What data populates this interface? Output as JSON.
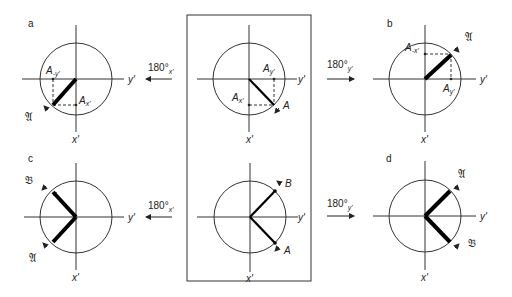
{
  "panels": {
    "a": {
      "letter": "a",
      "axis_y": "y'",
      "axis_x": "x'",
      "proj_neg_y": "A",
      "proj_neg_y_sub": "-y'",
      "proj_x": "A",
      "proj_x_sub": "x'",
      "vector": "𝔄"
    },
    "center_top": {
      "axis_y": "y'",
      "axis_x": "x'",
      "proj_y": "A",
      "proj_y_sub": "y'",
      "proj_x": "A",
      "proj_x_sub": "x'",
      "vector": "A"
    },
    "b": {
      "letter": "b",
      "axis_y": "y'",
      "axis_x": "x'",
      "proj_neg_x": "A",
      "proj_neg_x_sub": "-x'",
      "proj_y": "A",
      "proj_y_sub": "y'",
      "vector": "𝔄"
    },
    "c": {
      "letter": "c",
      "axis_y": "y'",
      "axis_x": "x'",
      "vector_1": "𝔅",
      "vector_2": "𝔄"
    },
    "center_bottom": {
      "axis_y": "y'",
      "axis_x": "x'",
      "vector_1": "B",
      "vector_2": "A"
    },
    "d": {
      "letter": "d",
      "axis_y": "y'",
      "axis_x": "x'",
      "vector_1": "𝔄",
      "vector_2": "𝔅"
    }
  },
  "rotations": {
    "top_left": {
      "angle": "180°",
      "axis": "x'"
    },
    "top_right": {
      "angle": "180°",
      "axis": "y'"
    },
    "bottom_left": {
      "angle": "180°",
      "axis": "x'"
    },
    "bottom_right": {
      "angle": "180°",
      "axis": "y'"
    }
  }
}
